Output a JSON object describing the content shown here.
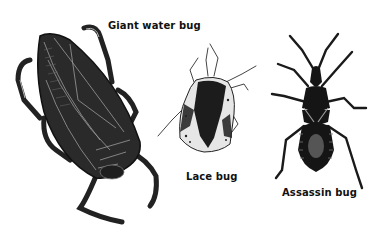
{
  "figure": {
    "background": "#ffffff",
    "bugs": [
      {
        "id": "giant-water-bug",
        "label": "Giant water bug",
        "color": "#2a2a2a"
      },
      {
        "id": "lace-bug",
        "label": "Lace bug",
        "color": "#1c1c1c",
        "pattern_color": "#e8e8e8"
      },
      {
        "id": "assassin-bug",
        "label": "Assassin bug",
        "color": "#151515",
        "accent_color": "#555555"
      }
    ]
  }
}
